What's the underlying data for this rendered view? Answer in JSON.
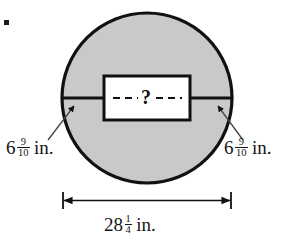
{
  "figure": {
    "bullet": "square-bullet",
    "colors": {
      "circle_fill": "#c9c9c9",
      "circle_stroke": "#111111",
      "rect_fill": "#ffffff",
      "rect_stroke": "#111111",
      "line": "#111111",
      "text": "#161616",
      "background": "#ffffff"
    },
    "unknown_marker": "?",
    "shapes": {
      "circle": {
        "cx": 147,
        "cy": 98,
        "r": 85
      },
      "chord": {
        "x1": 62,
        "y1": 98,
        "x2": 232,
        "y2": 98
      },
      "rectangle": {
        "x": 104,
        "y": 76,
        "width": 86,
        "height": 44
      }
    }
  },
  "labels": {
    "radius_left": {
      "whole": "6",
      "numerator": "9",
      "denominator": "10",
      "unit": "in.",
      "full_text": "6 9/10 in."
    },
    "radius_right": {
      "whole": "6",
      "numerator": "9",
      "denominator": "10",
      "unit": "in.",
      "full_text": "6 9/10 in."
    },
    "diameter": {
      "whole": "28",
      "numerator": "1",
      "denominator": "4",
      "unit": "in.",
      "full_text": "28 1/4 in."
    }
  },
  "annotations": {
    "leader_left": "arrow-pointing-to-chord-left",
    "leader_right": "arrow-pointing-to-chord-right",
    "dimension_line": "double-headed-arrow-with-end-ticks"
  }
}
